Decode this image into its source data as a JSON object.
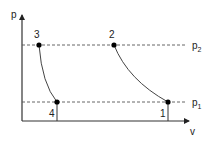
{
  "diagram": {
    "type": "p-v diagram",
    "axes": {
      "y_label": "p",
      "x_label": "v"
    },
    "isobars": [
      {
        "name": "p2",
        "label_main": "p",
        "label_sub": "2"
      },
      {
        "name": "p1",
        "label_main": "p",
        "label_sub": "1"
      }
    ],
    "points": [
      {
        "id": "1",
        "label": "1"
      },
      {
        "id": "2",
        "label": "2"
      },
      {
        "id": "3",
        "label": "3"
      },
      {
        "id": "4",
        "label": "4"
      }
    ],
    "colors": {
      "line": "#333333",
      "dashed": "#555555",
      "point": "#000000"
    }
  }
}
